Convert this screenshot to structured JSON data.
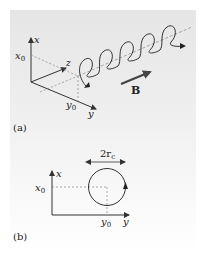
{
  "figure": {
    "panel_a": {
      "caption": "(a)",
      "axis_x_label": "x",
      "axis_y_label": "y",
      "axis_z_label": "z",
      "x0_label": "x",
      "x0_sub": "0",
      "y0_label": "y",
      "y0_sub": "0",
      "field_label": "B",
      "helix_turns": 5
    },
    "panel_b": {
      "caption": "(b)",
      "axis_x_label": "x",
      "axis_y_label": "y",
      "x0_label": "x",
      "x0_sub": "0",
      "y0_label": "y",
      "y0_sub": "0",
      "diameter_label": "2r",
      "diameter_sub": "c"
    },
    "colors": {
      "line": "#333333",
      "dashed": "#888888",
      "field_arrow": "#444444"
    }
  }
}
